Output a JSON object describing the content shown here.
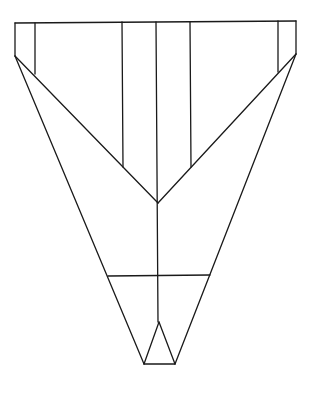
{
  "diagram": {
    "title": "",
    "stroke_color": "#1a1a1a",
    "background": "#ffffff",
    "lines": [
      {
        "name": "top-edge",
        "x1": 15,
        "y1": 23,
        "x2": 296,
        "y2": 21
      },
      {
        "name": "left-outer-edge",
        "x1": 15,
        "y1": 23,
        "x2": 15,
        "y2": 56
      },
      {
        "name": "right-outer-edge",
        "x1": 296,
        "y1": 21,
        "x2": 296,
        "y2": 54
      },
      {
        "name": "left-wing-fold",
        "x1": 35,
        "y1": 23,
        "x2": 35,
        "y2": 74
      },
      {
        "name": "right-wing-fold",
        "x1": 278,
        "y1": 21,
        "x2": 278,
        "y2": 72
      },
      {
        "name": "left-inner-fold",
        "x1": 122,
        "y1": 22,
        "x2": 123,
        "y2": 167
      },
      {
        "name": "right-inner-fold",
        "x1": 190,
        "y1": 22,
        "x2": 191,
        "y2": 167
      },
      {
        "name": "center-fold",
        "x1": 156,
        "y1": 22,
        "x2": 158,
        "y2": 322
      },
      {
        "name": "left-diagonal",
        "x1": 15,
        "y1": 56,
        "x2": 158,
        "y2": 203
      },
      {
        "name": "right-diagonal",
        "x1": 296,
        "y1": 54,
        "x2": 158,
        "y2": 203
      },
      {
        "name": "left-body-edge",
        "x1": 15,
        "y1": 56,
        "x2": 144,
        "y2": 364
      },
      {
        "name": "right-body-edge",
        "x1": 296,
        "y1": 54,
        "x2": 175,
        "y2": 364
      },
      {
        "name": "cross-fold",
        "x1": 108,
        "y1": 276,
        "x2": 210,
        "y2": 275
      },
      {
        "name": "nose-base",
        "x1": 144,
        "y1": 364,
        "x2": 175,
        "y2": 364
      },
      {
        "name": "nose-left",
        "x1": 144,
        "y1": 364,
        "x2": 159,
        "y2": 322
      },
      {
        "name": "nose-right",
        "x1": 175,
        "y1": 364,
        "x2": 159,
        "y2": 322
      }
    ]
  }
}
